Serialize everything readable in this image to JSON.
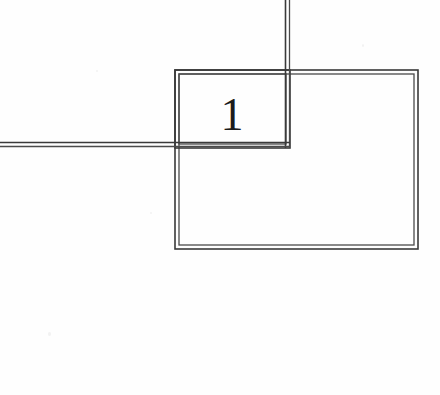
{
  "figure": {
    "kind": "technical-line-drawing",
    "background_color": "#fefefe",
    "stroke_color": "#3a3a3a",
    "stroke_color_light": "#6e6e6e",
    "canvas": {
      "width": 440,
      "height": 395
    },
    "label": {
      "text": "1",
      "x": 232,
      "y": 113,
      "font_size": 44,
      "color": "#1b1b1b"
    },
    "shapes": [
      {
        "name": "outer-rectangle",
        "type": "double-stroke-rect",
        "x": 175,
        "y": 70,
        "width": 243,
        "height": 179,
        "gap": 4
      },
      {
        "name": "inner-rectangle",
        "type": "double-stroke-rect",
        "x": 175,
        "y": 70,
        "width": 115,
        "height": 78,
        "gap": 4
      },
      {
        "name": "vertical-lead-line",
        "type": "double-stroke-line",
        "x1": 287,
        "y1": 0,
        "x2": 287,
        "y2": 148,
        "gap": 4
      },
      {
        "name": "horizontal-lead-line",
        "type": "double-stroke-line",
        "x1": 0,
        "y1": 145,
        "x2": 290,
        "y2": 145,
        "gap": 4
      }
    ]
  }
}
